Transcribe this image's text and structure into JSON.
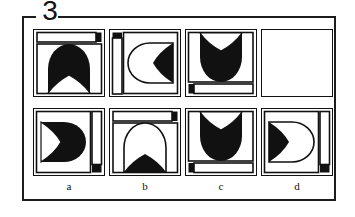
{
  "puzzle": {
    "number": "3",
    "type": "visual-analogy-matrix",
    "colors": {
      "ink": "#111111",
      "paper": "#ffffff",
      "frame": "#1c1c1c"
    },
    "top_row": {
      "name": "problem-row",
      "cells": [
        {
          "id": "problem-1",
          "filled": true,
          "orientation": "up",
          "bar": {
            "position": "top",
            "marker_end": "right"
          },
          "figure": "black-dome-with-white-pointed-arch"
        },
        {
          "id": "problem-2",
          "filled": true,
          "orientation": "left",
          "bar": {
            "position": "left",
            "marker_end": "top"
          },
          "figure": "white-dome-outline-with-black-crescent"
        },
        {
          "id": "problem-3",
          "filled": true,
          "orientation": "down",
          "bar": {
            "position": "bottom",
            "marker_end": "left"
          },
          "figure": "black-dome-with-white-crescent"
        },
        {
          "id": "problem-4",
          "filled": false,
          "orientation": "none",
          "bar": null,
          "figure": "empty-missing-piece"
        }
      ]
    },
    "bottom_row": {
      "name": "answer-options-row",
      "cells": [
        {
          "id": "option-a",
          "label": "a",
          "orientation": "right",
          "bar": {
            "position": "right",
            "marker_end": "bottom"
          },
          "figure": "black-dome-with-white-crescent"
        },
        {
          "id": "option-b",
          "label": "b",
          "orientation": "up",
          "bar": {
            "position": "top",
            "marker_end": "right"
          },
          "figure": "white-dome-outline-with-black-pointed-arch"
        },
        {
          "id": "option-c",
          "label": "c",
          "orientation": "down",
          "bar": {
            "position": "bottom",
            "marker_end": "left"
          },
          "figure": "black-dome-with-white-crescent"
        },
        {
          "id": "option-d",
          "label": "d",
          "orientation": "right",
          "bar": {
            "position": "right",
            "marker_end": "bottom"
          },
          "figure": "white-dome-outline-with-black-crescent"
        }
      ]
    },
    "option_labels": [
      "a",
      "b",
      "c",
      "d"
    ]
  }
}
